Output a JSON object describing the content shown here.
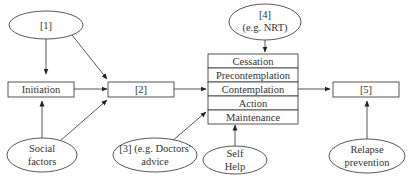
{
  "diagram": {
    "type": "flowchart",
    "colors": {
      "stroke": "#444444",
      "text": "#333333",
      "background": "#ffffff"
    },
    "nodes": {
      "n1": {
        "shape": "ellipse",
        "lines": [
          "[1]"
        ]
      },
      "n4": {
        "shape": "ellipse",
        "lines": [
          "[4]",
          "(e.g. NRT)"
        ]
      },
      "initiation": {
        "shape": "box",
        "lines": [
          "Initiation"
        ]
      },
      "n2": {
        "shape": "box",
        "lines": [
          "[2]"
        ]
      },
      "stages": {
        "shape": "stacked-box",
        "rows": [
          "Cessation",
          "Precontemplation",
          "Contemplation",
          "Action",
          "Maintenance"
        ]
      },
      "n5": {
        "shape": "box",
        "lines": [
          "[5]"
        ]
      },
      "social": {
        "shape": "ellipse",
        "lines": [
          "Social",
          "factors"
        ]
      },
      "n3": {
        "shape": "ellipse",
        "lines": [
          "[3] (e.g. Doctors'",
          "advice"
        ]
      },
      "selfhelp": {
        "shape": "ellipse",
        "lines": [
          "Self",
          "Help"
        ]
      },
      "relapse": {
        "shape": "ellipse",
        "lines": [
          "Relapse",
          "prevention"
        ]
      }
    },
    "edges": [
      {
        "from": "n1",
        "to": "initiation"
      },
      {
        "from": "n1",
        "to": "n2"
      },
      {
        "from": "initiation",
        "to": "n2"
      },
      {
        "from": "social",
        "to": "initiation"
      },
      {
        "from": "social",
        "to": "n2"
      },
      {
        "from": "n2",
        "to": "stages"
      },
      {
        "from": "n4",
        "to": "stages"
      },
      {
        "from": "n3",
        "to": "stages"
      },
      {
        "from": "selfhelp",
        "to": "stages"
      },
      {
        "from": "stages",
        "to": "n5"
      },
      {
        "from": "relapse",
        "to": "n5"
      }
    ]
  }
}
